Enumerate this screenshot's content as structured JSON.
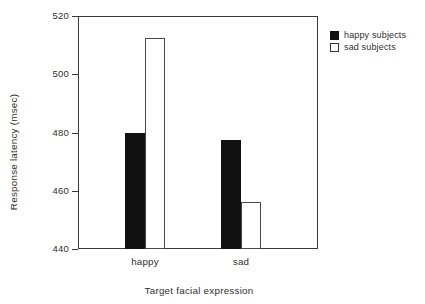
{
  "chart_data": {
    "type": "bar",
    "title": "",
    "xlabel": "Target facial expression",
    "ylabel": "Response latency (msec)",
    "categories": [
      "happy",
      "sad"
    ],
    "series": [
      {
        "name": "happy subjects",
        "values": [
          480,
          477.5
        ],
        "color": "#111111",
        "style": "filled"
      },
      {
        "name": "sad subjects",
        "values": [
          512.5,
          456
        ],
        "color": "#ffffff",
        "style": "open"
      }
    ],
    "ylim": [
      440,
      520
    ],
    "yticks": [
      440,
      460,
      480,
      500,
      520
    ],
    "ytick_labels": [
      "440",
      "460",
      "480",
      "500",
      "520"
    ],
    "grid": false,
    "legend_position": "top-right",
    "frame": true
  },
  "axes": {
    "y_title": "Response latency (msec)",
    "x_title": "Target facial expression",
    "y_ticks": [
      "520",
      "500",
      "480",
      "460",
      "440"
    ],
    "x_ticks": [
      "happy",
      "sad"
    ]
  },
  "legend": {
    "items": [
      {
        "label": "happy subjects",
        "swatch": "filled-square"
      },
      {
        "label": "sad subjects",
        "swatch": "open-square"
      }
    ]
  }
}
